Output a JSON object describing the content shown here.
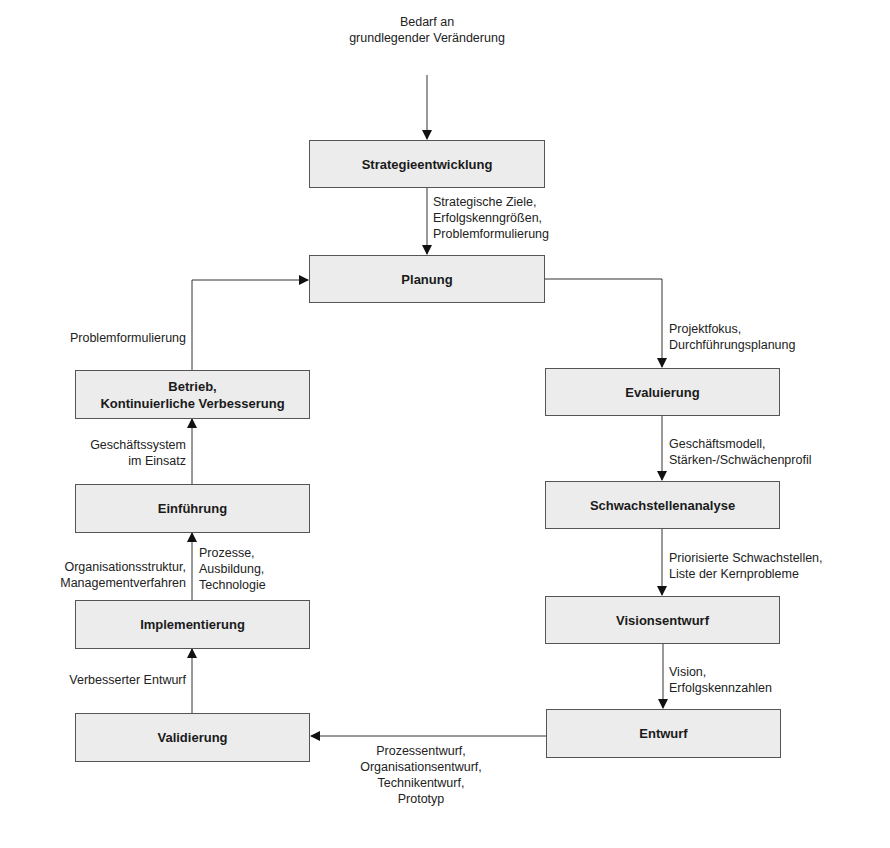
{
  "diagram": {
    "input_label": [
      "Bedarf an",
      "grundlegender Veränderung"
    ],
    "boxes": {
      "strategie": "Strategieentwicklung",
      "planung": "Planung",
      "betrieb": [
        "Betrieb,",
        "Kontinuierliche Verbesserung"
      ],
      "einfuehrung": "Einführung",
      "implementierung": "Implementierung",
      "validierung": "Validierung",
      "evaluierung": "Evaluierung",
      "schwachstellen": "Schwachstellenanalyse",
      "vision": "Visionsentwurf",
      "entwurf": "Entwurf"
    },
    "edge_labels": {
      "strategie_planung": [
        "Strategische Ziele,",
        "Erfolgskenngrößen,",
        "Problemformulierung"
      ],
      "planung_evaluierung": [
        "Projektfokus,",
        "Durchführungsplanung"
      ],
      "evaluierung_schwachstellen": [
        "Geschäftsmodell,",
        "Stärken-/Schwächenprofil"
      ],
      "schwachstellen_vision": [
        "Priorisierte Schwachstellen,",
        "Liste der Kernprobleme"
      ],
      "vision_entwurf": [
        "Vision,",
        "Erfolgskennzahlen"
      ],
      "entwurf_validierung": [
        "Prozessentwurf,",
        "Organisationsentwurf,",
        "Technikentwurf,",
        "Prototyp"
      ],
      "validierung_implementierung": [
        "Verbesserter Entwurf"
      ],
      "implementierung_einfuehrung_left": [
        "Organisationsstruktur,",
        "Managementverfahren"
      ],
      "implementierung_einfuehrung_right": [
        "Prozesse,",
        "Ausbildung,",
        "Technologie"
      ],
      "einfuehrung_betrieb": [
        "Geschäftssystem",
        "im Einsatz"
      ],
      "betrieb_planung": [
        "Problemformulierung"
      ]
    },
    "colors": {
      "box_fill": "#ececec",
      "box_border": "#555555",
      "line": "#333333"
    }
  }
}
